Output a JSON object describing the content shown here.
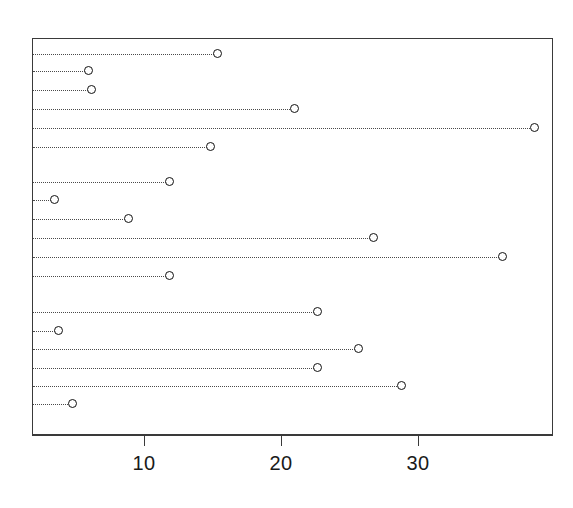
{
  "chart_data": {
    "type": "scatter",
    "subtype": "cleveland-dot-plot",
    "title": "",
    "subtitle": "",
    "xlabel": "",
    "ylabel": "",
    "xlim": [
      0.6,
      38.6
    ],
    "ylim": [
      0,
      19
    ],
    "grid": false,
    "legend": null,
    "orientation": "horizontal",
    "marker": "open-circle",
    "leader_line_style": "dotted",
    "axis_ticks": {
      "x": [
        10,
        20,
        30
      ],
      "x_labels": [
        "10",
        "20",
        "30"
      ],
      "y": [],
      "y_labels": []
    },
    "categories": [
      "row-1",
      "row-2",
      "row-3",
      "row-4",
      "row-5",
      "row-6",
      "row-7",
      "row-8",
      "row-9",
      "row-10",
      "row-11",
      "row-12",
      "row-13",
      "row-14",
      "row-15",
      "row-16",
      "row-17",
      "row-18"
    ],
    "values": [
      15.3,
      5.9,
      6.1,
      20.9,
      38.4,
      14.8,
      11.8,
      3.4,
      8.8,
      26.7,
      36.1,
      11.8,
      22.6,
      3.7,
      25.6,
      22.6,
      28.7,
      4.7
    ],
    "groups": [
      {
        "name": "group-1",
        "row_indices": [
          0,
          1,
          2,
          3,
          4,
          5
        ]
      },
      {
        "name": "group-2",
        "row_indices": [
          6,
          7,
          8,
          9,
          10,
          11
        ]
      },
      {
        "name": "group-3",
        "row_indices": [
          12,
          13,
          14,
          15,
          16,
          17
        ]
      }
    ],
    "points": [
      {
        "index": 1,
        "value": 15.3,
        "y_px": 53,
        "group": "group-1"
      },
      {
        "index": 2,
        "value": 5.9,
        "y_px": 70,
        "group": "group-1"
      },
      {
        "index": 3,
        "value": 6.1,
        "y_px": 89,
        "group": "group-1"
      },
      {
        "index": 4,
        "value": 20.9,
        "y_px": 108,
        "group": "group-1"
      },
      {
        "index": 5,
        "value": 38.4,
        "y_px": 127,
        "group": "group-1"
      },
      {
        "index": 6,
        "value": 14.8,
        "y_px": 146,
        "group": "group-1"
      },
      {
        "index": 7,
        "value": 11.8,
        "y_px": 181,
        "group": "group-2"
      },
      {
        "index": 8,
        "value": 3.4,
        "y_px": 199,
        "group": "group-2"
      },
      {
        "index": 9,
        "value": 8.8,
        "y_px": 218,
        "group": "group-2"
      },
      {
        "index": 10,
        "value": 26.7,
        "y_px": 237,
        "group": "group-2"
      },
      {
        "index": 11,
        "value": 36.1,
        "y_px": 256,
        "group": "group-2"
      },
      {
        "index": 12,
        "value": 11.8,
        "y_px": 275,
        "group": "group-2"
      },
      {
        "index": 13,
        "value": 22.6,
        "y_px": 311,
        "group": "group-3"
      },
      {
        "index": 14,
        "value": 3.7,
        "y_px": 330,
        "group": "group-3"
      },
      {
        "index": 15,
        "value": 25.6,
        "y_px": 348,
        "group": "group-3"
      },
      {
        "index": 16,
        "value": 22.6,
        "y_px": 367,
        "group": "group-3"
      },
      {
        "index": 17,
        "value": 28.7,
        "y_px": 385,
        "group": "group-3"
      },
      {
        "index": 18,
        "value": 4.7,
        "y_px": 403,
        "group": "group-3"
      }
    ]
  },
  "colors": {
    "frame": "#3a3a3a",
    "marker_stroke": "#111111",
    "marker_fill": "#ffffff",
    "leader": "#4a4a4a",
    "tick_label": "#1a1a1a",
    "background": "#ffffff"
  },
  "geometry": {
    "plot_left_px": 32,
    "plot_right_px": 553,
    "plot_top_px": 38,
    "plot_bottom_px": 435,
    "x_px_at_10": 144,
    "px_per_unit": 13.7
  }
}
